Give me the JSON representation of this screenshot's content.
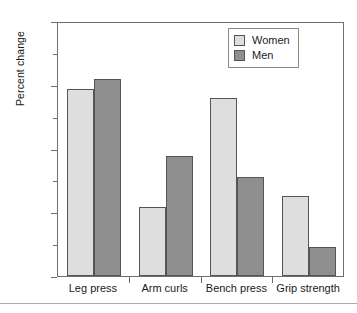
{
  "chart_data": {
    "type": "bar",
    "title": "",
    "xlabel": "",
    "ylabel": "Percent change",
    "ylim": [
      0,
      40
    ],
    "yticks": [
      0,
      10,
      20,
      30,
      40
    ],
    "ytick_labels": [
      "0",
      "10",
      "20",
      "30",
      "40"
    ],
    "yminor_ticks": [
      5,
      15,
      25,
      35
    ],
    "grid": false,
    "legend_position": "top-right",
    "categories": [
      "Leg press",
      "Arm curls",
      "Bench press",
      "Grip strength"
    ],
    "series": [
      {
        "name": "Women",
        "color": "#dedede",
        "values": [
          29.3,
          10.8,
          28.0,
          12.5
        ]
      },
      {
        "name": "Men",
        "color": "#8f8f8f",
        "values": [
          30.9,
          18.8,
          15.6,
          4.6
        ]
      }
    ]
  },
  "legend": {
    "entries": [
      {
        "label": "Women",
        "swatch": "#dedede"
      },
      {
        "label": "Men",
        "swatch": "#8f8f8f"
      }
    ]
  },
  "axes": {
    "y_title": "Percent change"
  }
}
